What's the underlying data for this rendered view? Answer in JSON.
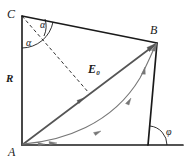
{
  "figure": {
    "type": "geometry-vector-diagram",
    "width": 188,
    "height": 168,
    "background": "#ffffff",
    "ink_color": "#1a1a1a",
    "vector_color": "#555555",
    "curve_color": "#777777"
  },
  "points": {
    "C": {
      "label": "C",
      "x": 22,
      "y": 16
    },
    "B": {
      "label": "B",
      "x": 157,
      "y": 43
    },
    "A": {
      "label": "A",
      "x": 22,
      "y": 145
    },
    "phi_vertex": {
      "x": 148,
      "y": 145
    },
    "base_end": {
      "x": 183,
      "y": 145
    },
    "dash_end": {
      "x": 89,
      "y": 93
    }
  },
  "labels": {
    "point_c": "C",
    "point_b": "B",
    "point_a": "A",
    "side_r": "R",
    "vector_e": "E",
    "vector_e_sub": "0",
    "angle_alpha_upper": "α",
    "angle_alpha_lower": "α",
    "angle_phi": "φ"
  },
  "segments": [
    {
      "name": "side-CB",
      "from": "C",
      "to": "B",
      "style": "solid",
      "color": "#1a1a1a"
    },
    {
      "name": "side-CA",
      "from": "C",
      "to": "A",
      "style": "solid",
      "color": "#1a1a1a"
    },
    {
      "name": "base-line",
      "from": "A",
      "to": "base_end",
      "style": "solid",
      "color": "#1a1a1a"
    },
    {
      "name": "side-B-to-base",
      "from": "B",
      "to": "phi_vertex",
      "style": "solid",
      "color": "#1a1a1a"
    },
    {
      "name": "bisector-dashed",
      "from": "C",
      "to": "dash_end",
      "style": "dashed",
      "color": "#1a1a1a"
    },
    {
      "name": "vector-AB",
      "from": "A",
      "to": "B",
      "style": "solid-arrow",
      "color": "#555555"
    },
    {
      "name": "trajectory-curve",
      "from": "A",
      "to": "B",
      "style": "curved-arrow",
      "color": "#777777"
    }
  ],
  "angles": [
    {
      "name": "alpha-upper",
      "vertex": "C",
      "symbol": "α",
      "between": [
        "side-CB",
        "bisector-dashed"
      ]
    },
    {
      "name": "alpha-lower",
      "vertex": "C",
      "symbol": "α",
      "between": [
        "bisector-dashed",
        "side-CA"
      ]
    },
    {
      "name": "phi",
      "vertex": "phi_vertex",
      "symbol": "φ",
      "between": [
        "base-line",
        "side-B-to-base"
      ]
    }
  ]
}
